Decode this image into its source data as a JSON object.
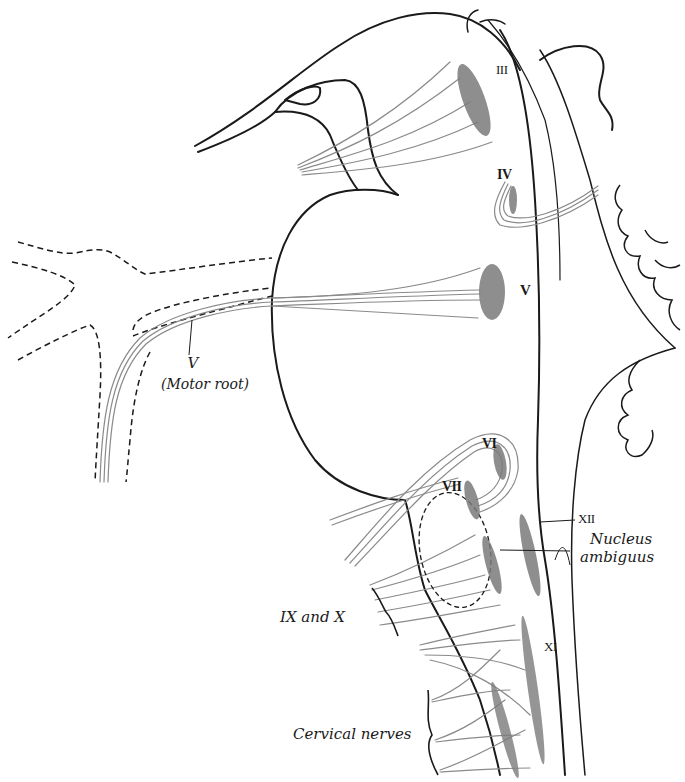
{
  "figure": {
    "type": "anatomical line drawing",
    "ink_color": "#1a1a1a",
    "nerve_fiber_color": "#8a8a8a",
    "nucleus_stipple_color": "#7a7a7a",
    "background": "#ffffff"
  },
  "labels": {
    "nucleus_iii": "III",
    "nucleus_iv": "IV",
    "nucleus_v": "V",
    "motor_root_v_numeral": "V",
    "motor_root_v_text": "(Motor root)",
    "nucleus_vi": "VI",
    "nucleus_vii": "VII",
    "nucleus_xii": "XII",
    "nucleus_ambiguus_line1": "Nucleus",
    "nucleus_ambiguus_line2": "ambiguus",
    "nerves_ix_x": "IX and X",
    "nucleus_xi": "XI",
    "cervical_nerves": "Cervical nerves"
  }
}
